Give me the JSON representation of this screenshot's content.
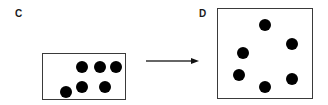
{
  "panels": [
    {
      "label": "C",
      "label_pos": [
        15,
        9
      ],
      "box": {
        "x": 42,
        "y": 53,
        "w": 84,
        "h": 47
      },
      "dots": [
        [
          82,
          67
        ],
        [
          100,
          67
        ],
        [
          116,
          67
        ],
        [
          82,
          87
        ],
        [
          105,
          87
        ],
        [
          66,
          92
        ]
      ]
    },
    {
      "label": "D",
      "label_pos": [
        199,
        9
      ],
      "box": {
        "x": 217,
        "y": 8,
        "w": 96,
        "h": 91
      },
      "dots": [
        [
          265,
          25
        ],
        [
          292,
          44
        ],
        [
          243,
          53
        ],
        [
          239,
          75
        ],
        [
          265,
          87
        ],
        [
          292,
          79
        ]
      ]
    }
  ],
  "arrow": {
    "x1": 146,
    "y1": 61,
    "x2": 199,
    "y2": 61,
    "color": "#333333"
  },
  "colors": {
    "dot": "#000000",
    "border": "#3a3a3a"
  }
}
